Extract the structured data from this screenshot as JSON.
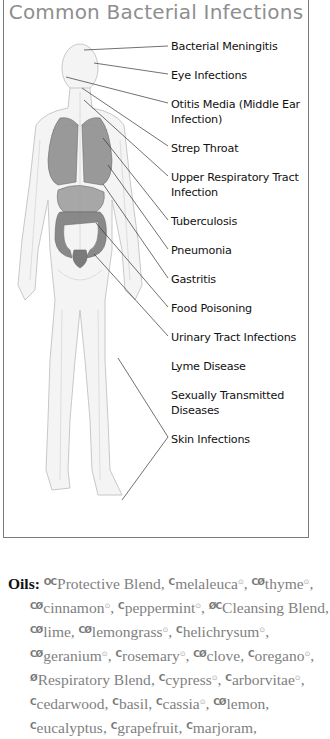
{
  "title": "Common Bacterial Infections",
  "labels": [
    {
      "text": "Bacterial Meningitis",
      "y": 39
    },
    {
      "text": "Eye Infections",
      "y": 68
    },
    {
      "text": "Otitis Media (Middle Ear Infection)",
      "y": 97
    },
    {
      "text": "Strep Throat",
      "y": 141
    },
    {
      "text": "Upper Respiratory Tract Infection",
      "y": 170
    },
    {
      "text": "Tuberculosis",
      "y": 214
    },
    {
      "text": "Pneumonia",
      "y": 243
    },
    {
      "text": "Gastritis",
      "y": 272
    },
    {
      "text": "Food Poisoning",
      "y": 301
    },
    {
      "text": "Urinary Tract Infections",
      "y": 330
    },
    {
      "text": "Lyme Disease",
      "y": 359
    },
    {
      "text": "Sexually Transmitted Diseases",
      "y": 388
    },
    {
      "text": "Skin Infections",
      "y": 432
    }
  ],
  "oils": {
    "heading": "Oils:",
    "items": [
      {
        "icons": "OC",
        "name": "Protective Blend",
        "sup": false
      },
      {
        "icons": "C",
        "name": "melaleuca",
        "sup": true
      },
      {
        "icons": "CØ",
        "name": "thyme",
        "sup": true
      },
      {
        "icons": "CØ",
        "name": "cinnamon",
        "sup": true
      },
      {
        "icons": "C",
        "name": "peppermint",
        "sup": true
      },
      {
        "icons": "ØC",
        "name": "Cleansing Blend",
        "sup": false
      },
      {
        "icons": "CØ",
        "name": "lime",
        "sup": false
      },
      {
        "icons": "CØ",
        "name": "lemongrass",
        "sup": true
      },
      {
        "icons": "C",
        "name": "helichrysum",
        "sup": true
      },
      {
        "icons": "CØ",
        "name": "geranium",
        "sup": true
      },
      {
        "icons": "C",
        "name": "rosemary",
        "sup": true
      },
      {
        "icons": "CØ",
        "name": "clove",
        "sup": false
      },
      {
        "icons": "C",
        "name": "oregano",
        "sup": true
      },
      {
        "icons": "Ø",
        "name": "Respiratory Blend",
        "sup": false
      },
      {
        "icons": "C",
        "name": "cypress",
        "sup": true
      },
      {
        "icons": "C",
        "name": "arborvitae",
        "sup": true
      },
      {
        "icons": "C",
        "name": "cedarwood",
        "sup": false
      },
      {
        "icons": "C",
        "name": "basil",
        "sup": false
      },
      {
        "icons": "C",
        "name": "cassia",
        "sup": true
      },
      {
        "icons": "CØ",
        "name": "lemon",
        "sup": false
      },
      {
        "icons": "C",
        "name": "eucalyptus",
        "sup": false
      },
      {
        "icons": "C",
        "name": "grapefruit",
        "sup": false
      },
      {
        "icons": "C",
        "name": "marjoram",
        "sup": false
      }
    ],
    "sup_glyph": "⊙"
  },
  "colors": {
    "title": "#8e8e8e",
    "frame": "#7a7a7a",
    "organ": "#6e6e6e",
    "body_outline": "#c8c8c8",
    "leader": "#333333"
  }
}
